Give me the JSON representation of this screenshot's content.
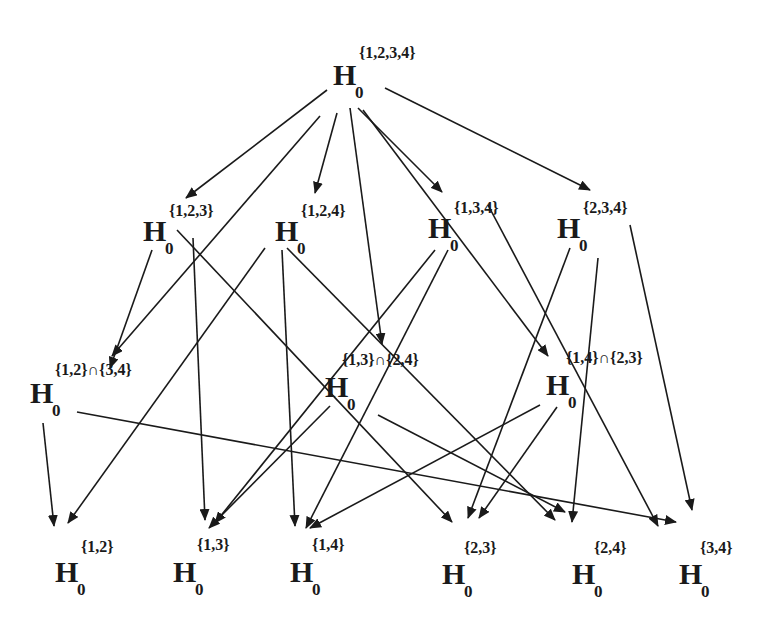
{
  "diagram": {
    "title": "",
    "line_color": "#1a1a1a",
    "nodes": {
      "n1234": {
        "label": "H",
        "sub": "0",
        "sup": "{1,2,3,4}"
      },
      "n123": {
        "label": "H",
        "sub": "0",
        "sup": "{1,2,3}"
      },
      "n124": {
        "label": "H",
        "sub": "0",
        "sup": "{1,2,4}"
      },
      "n134": {
        "label": "H",
        "sub": "0",
        "sup": "{1,3,4}"
      },
      "n234": {
        "label": "H",
        "sub": "0",
        "sup": "{2,3,4}"
      },
      "n12_34": {
        "label": "H",
        "sub": "0",
        "sup": "{1,2}∩{3,4}"
      },
      "n13_24": {
        "label": "H",
        "sub": "0",
        "sup": "{1,3}∩{2,4}"
      },
      "n14_23": {
        "label": "H",
        "sub": "0",
        "sup": "{1,4}∩{2,3}"
      },
      "n12": {
        "label": "H",
        "sub": "0",
        "sup": "{1,2}"
      },
      "n13": {
        "label": "H",
        "sub": "0",
        "sup": "{1,3}"
      },
      "n14": {
        "label": "H",
        "sub": "0",
        "sup": "{1,4}"
      },
      "n23": {
        "label": "H",
        "sub": "0",
        "sup": "{2,3}"
      },
      "n24": {
        "label": "H",
        "sub": "0",
        "sup": "{2,4}"
      },
      "n34": {
        "label": "H",
        "sub": "0",
        "sup": "{3,4}"
      }
    },
    "edges": [
      {
        "from": "{1,2,3,4}",
        "to": "{1,2,3}"
      },
      {
        "from": "{1,2,3,4}",
        "to": "{1,2}∩{3,4}"
      },
      {
        "from": "{1,2,3,4}",
        "to": "{1,2,4}"
      },
      {
        "from": "{1,2,3,4}",
        "to": "{1,3}∩{2,4}"
      },
      {
        "from": "{1,2,3,4}",
        "to": "{1,3,4}"
      },
      {
        "from": "{1,2,3,4}",
        "to": "{1,4}∩{2,3}"
      },
      {
        "from": "{1,2,3,4}",
        "to": "{2,3,4}"
      },
      {
        "from": "{1,2,3}",
        "to": "{1,2}"
      },
      {
        "from": "{1,2,3}",
        "to": "{1,3}"
      },
      {
        "from": "{1,2,3}",
        "to": "{2,3}"
      },
      {
        "from": "{1,2,4}",
        "to": "{1,2}"
      },
      {
        "from": "{1,2,4}",
        "to": "{1,4}"
      },
      {
        "from": "{1,2,4}",
        "to": "{2,4}"
      },
      {
        "from": "{1,3,4}",
        "to": "{1,3}"
      },
      {
        "from": "{1,3,4}",
        "to": "{1,4}"
      },
      {
        "from": "{1,3,4}",
        "to": "{3,4}"
      },
      {
        "from": "{2,3,4}",
        "to": "{2,3}"
      },
      {
        "from": "{2,3,4}",
        "to": "{2,4}"
      },
      {
        "from": "{2,3,4}",
        "to": "{3,4}"
      },
      {
        "from": "{1,2}∩{3,4}",
        "to": "{1,2}"
      },
      {
        "from": "{1,2}∩{3,4}",
        "to": "{3,4}"
      },
      {
        "from": "{1,3}∩{2,4}",
        "to": "{1,3}"
      },
      {
        "from": "{1,3}∩{2,4}",
        "to": "{2,4}"
      },
      {
        "from": "{1,4}∩{2,3}",
        "to": "{1,4}"
      },
      {
        "from": "{1,4}∩{2,3}",
        "to": "{2,3}"
      }
    ]
  }
}
